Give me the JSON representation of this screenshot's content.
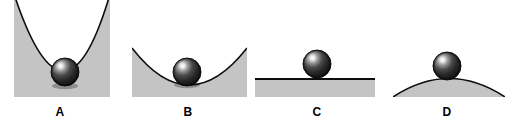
{
  "figure": {
    "width": 513,
    "height": 123,
    "background_color": "#ffffff",
    "surface_fill_color": "#c4c4c4",
    "surface_line_color": "#0d0d0d",
    "ball_dark_color": "#1b1b1b",
    "ball_mid_color": "#3c3c3c",
    "ball_highlight_color": "#f2f2f2",
    "label_color": "#000000"
  },
  "panels": [
    {
      "id": "panel-a",
      "label": "A",
      "label_x": 40,
      "label_y": 106,
      "surface_shape": "steep-parabolic-valley",
      "ball_position": "bottom-of-valley",
      "equilibrium": "stable",
      "ball": {
        "cx": 65,
        "cy": 72,
        "r": 14
      },
      "box": {
        "x": 14,
        "y": 0,
        "width": 96,
        "height": 97
      },
      "curve_path": "M 14 0 Q 65 140 110 0",
      "fill_path": "M 14 0 Q 65 140 110 0 L 110 97 L 14 97 Z"
    },
    {
      "id": "panel-b",
      "label": "B",
      "label_x": 168,
      "label_y": 106,
      "surface_shape": "shallow-parabolic-valley",
      "ball_position": "bottom-of-valley",
      "equilibrium": "stable",
      "ball": {
        "cx": 187,
        "cy": 72,
        "r": 14
      },
      "box": {
        "x": 132,
        "y": 48,
        "width": 115,
        "height": 49
      },
      "curve_path": "M 132 48 Q 189 122 247 48",
      "fill_path": "M 132 48 Q 189 122 247 48 L 247 97 L 132 97 Z"
    },
    {
      "id": "panel-c",
      "label": "C",
      "label_x": 297,
      "label_y": 106,
      "surface_shape": "flat-horizontal-plane",
      "ball_position": "resting-on-flat-surface",
      "equilibrium": "neutral",
      "ball": {
        "cx": 317,
        "cy": 64,
        "r": 14
      },
      "box": {
        "x": 255,
        "y": 79,
        "width": 120,
        "height": 18
      },
      "curve_path": "M 255 79 L 375 79",
      "fill_path": "M 255 79 L 375 79 L 375 97 L 255 97 Z"
    },
    {
      "id": "panel-d",
      "label": "D",
      "label_x": 427,
      "label_y": 106,
      "surface_shape": "convex-dome-hill",
      "ball_position": "on-top-of-dome",
      "equilibrium": "unstable",
      "ball": {
        "cx": 447,
        "cy": 66,
        "r": 14
      },
      "box": {
        "x": 393,
        "y": 78,
        "width": 112,
        "height": 19
      },
      "curve_path": "M 393 97 Q 449 62 505 97",
      "fill_path": "M 393 97 Q 449 62 505 97 Z"
    }
  ]
}
